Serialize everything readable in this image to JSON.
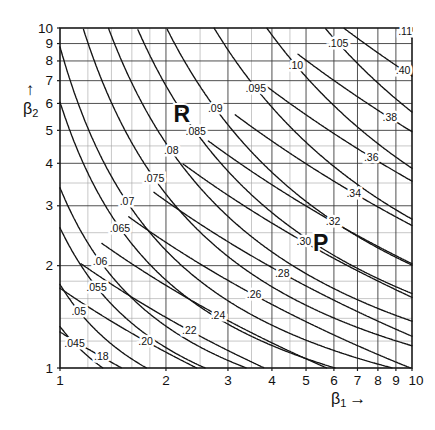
{
  "figure": {
    "colors": {
      "background": "#ffffff",
      "curve": "#141414",
      "major_grid": "#3c3c3c",
      "minor_grid": "#a2a2a2",
      "frame": "#1a1a1a",
      "text": "#111111"
    },
    "axes": {
      "x": {
        "label_main": "β",
        "label_sub": "1",
        "arrow": "→",
        "scale": "log",
        "min": 1,
        "max": 10,
        "tick_labels": [
          "1",
          "2",
          "3",
          "4",
          "5",
          "6",
          "7",
          "8",
          "9",
          "10"
        ],
        "ticks": [
          1,
          2,
          3,
          4,
          5,
          6,
          7,
          8,
          9,
          10
        ],
        "minor_gridlines": [
          1.2,
          1.4,
          1.6,
          1.8,
          2.5,
          3.5,
          4.5
        ]
      },
      "y": {
        "label_main": "β",
        "label_sub": "2",
        "arrow": "↑",
        "scale": "log",
        "min": 1,
        "max": 10,
        "tick_labels": [
          "1",
          "2",
          "3",
          "4",
          "5",
          "6",
          "7",
          "8",
          "9",
          "10"
        ],
        "ticks": [
          1,
          2,
          3,
          4,
          5,
          6,
          7,
          8,
          9,
          10
        ],
        "minor_gridlines": [
          1.2,
          1.4,
          1.6,
          1.8,
          2.5,
          3.5,
          4.5
        ]
      }
    }
  },
  "chart_data": {
    "type": "line",
    "variant": "contour-families",
    "title": "",
    "xlabel": "β1",
    "ylabel": "β2",
    "xlim": [
      1,
      10
    ],
    "ylim": [
      1,
      10
    ],
    "xscale": "log",
    "yscale": "log",
    "grid": "on",
    "series": [
      {
        "name": "R",
        "letter_pos": {
          "beta1": 2.22,
          "beta2": 5.6
        },
        "contours": [
          {
            "level": 0.045,
            "label": ".045",
            "anchor": {
              "beta1": 1.1,
              "beta2": 1.18
            }
          },
          {
            "level": 0.05,
            "label": ".05",
            "anchor": {
              "beta1": 1.13,
              "beta2": 1.47
            }
          },
          {
            "level": 0.055,
            "label": ".055",
            "anchor": {
              "beta1": 1.27,
              "beta2": 1.73
            }
          },
          {
            "level": 0.06,
            "label": ".06",
            "anchor": {
              "beta1": 1.3,
              "beta2": 2.06
            }
          },
          {
            "level": 0.065,
            "label": ".065",
            "anchor": {
              "beta1": 1.48,
              "beta2": 2.58
            }
          },
          {
            "level": 0.07,
            "label": ".07",
            "anchor": {
              "beta1": 1.55,
              "beta2": 3.08
            }
          },
          {
            "level": 0.075,
            "label": ".075",
            "anchor": {
              "beta1": 1.85,
              "beta2": 3.62
            }
          },
          {
            "level": 0.08,
            "label": ".08",
            "anchor": {
              "beta1": 2.07,
              "beta2": 4.35
            }
          },
          {
            "level": 0.085,
            "label": ".085",
            "anchor": {
              "beta1": 2.43,
              "beta2": 4.95
            }
          },
          {
            "level": 0.09,
            "label": ".09",
            "anchor": {
              "beta1": 2.76,
              "beta2": 5.81
            }
          },
          {
            "level": 0.095,
            "label": ".095",
            "anchor": {
              "beta1": 3.6,
              "beta2": 6.66
            }
          },
          {
            "level": 0.1,
            "label": ".10",
            "anchor": {
              "beta1": 4.68,
              "beta2": 7.77
            }
          },
          {
            "level": 0.105,
            "label": ".105",
            "anchor": {
              "beta1": 6.17,
              "beta2": 9.03
            }
          },
          {
            "level": 0.11,
            "label": ".11",
            "anchor": {
              "beta1": 9.56,
              "beta2": 9.79
            }
          }
        ]
      },
      {
        "name": "P",
        "letter_pos": {
          "beta1": 5.5,
          "beta2": 2.33
        },
        "contours": [
          {
            "level": 0.18,
            "label": ".18",
            "anchor": {
              "beta1": 1.31,
              "beta2": 1.08
            }
          },
          {
            "level": 0.2,
            "label": ".20",
            "anchor": {
              "beta1": 1.75,
              "beta2": 1.2
            }
          },
          {
            "level": 0.22,
            "label": ".22",
            "anchor": {
              "beta1": 2.33,
              "beta2": 1.29
            }
          },
          {
            "level": 0.24,
            "label": ".24",
            "anchor": {
              "beta1": 2.81,
              "beta2": 1.43
            }
          },
          {
            "level": 0.26,
            "label": ".26",
            "anchor": {
              "beta1": 3.56,
              "beta2": 1.64
            }
          },
          {
            "level": 0.28,
            "label": ".28",
            "anchor": {
              "beta1": 4.28,
              "beta2": 1.9
            }
          },
          {
            "level": 0.3,
            "label": ".30",
            "anchor": {
              "beta1": 4.93,
              "beta2": 2.35
            }
          },
          {
            "level": 0.32,
            "label": ".32",
            "anchor": {
              "beta1": 5.97,
              "beta2": 2.69
            }
          },
          {
            "level": 0.34,
            "label": ".34",
            "anchor": {
              "beta1": 6.83,
              "beta2": 3.27
            }
          },
          {
            "level": 0.36,
            "label": ".36",
            "anchor": {
              "beta1": 7.66,
              "beta2": 4.17
            }
          },
          {
            "level": 0.38,
            "label": ".38",
            "anchor": {
              "beta1": 8.65,
              "beta2": 5.44
            }
          },
          {
            "level": 0.4,
            "label": ".40",
            "anchor": {
              "beta1": 9.43,
              "beta2": 7.52
            }
          }
        ]
      }
    ]
  }
}
